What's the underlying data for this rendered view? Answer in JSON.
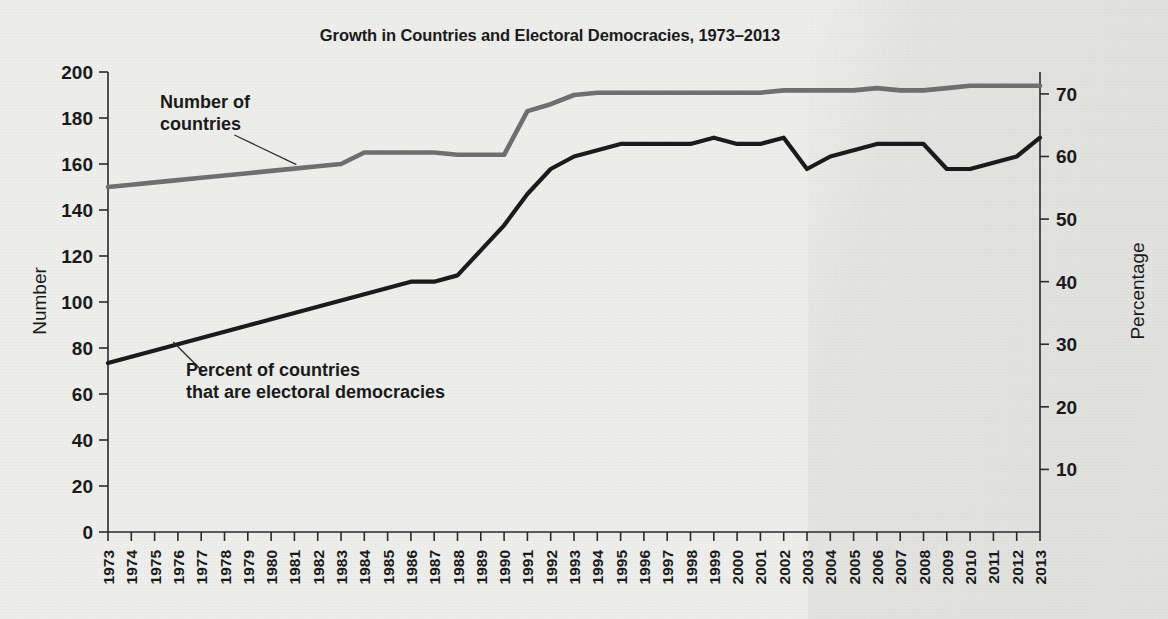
{
  "figure": {
    "title": "Growth in Countries and Electoral Democracies, 1973–2013",
    "left_axis_title": "Number",
    "right_axis_title": "Percentage",
    "annotation_countries": "Number of",
    "annotation_countries_2": "countries",
    "annotation_percent": "Percent of countries",
    "annotation_percent_2": "that are electoral democracies"
  },
  "colors": {
    "countries_line": "#6f6f6f",
    "democracies_line": "#1b1b1b",
    "axis": "#2b2b2b",
    "background": "#eeeeec"
  },
  "chart_data": {
    "type": "line",
    "title": "Growth in Countries and Electoral Democracies, 1973–2013",
    "xlabel": "",
    "ylabel": "Number",
    "y2label": "Percentage",
    "ylim": [
      0,
      200
    ],
    "y2lim": [
      0,
      73.5
    ],
    "yticks": [
      0,
      20,
      40,
      60,
      80,
      100,
      120,
      140,
      160,
      180,
      200
    ],
    "y2ticks": [
      10,
      20,
      30,
      40,
      50,
      60,
      70
    ],
    "grid": false,
    "legend": "annotations-inline",
    "x": [
      1973,
      1974,
      1975,
      1976,
      1977,
      1978,
      1979,
      1980,
      1981,
      1982,
      1983,
      1984,
      1985,
      1986,
      1987,
      1988,
      1989,
      1990,
      1991,
      1992,
      1993,
      1994,
      1995,
      1996,
      1997,
      1998,
      1999,
      2000,
      2001,
      2002,
      2003,
      2004,
      2005,
      2006,
      2007,
      2008,
      2009,
      2010,
      2011,
      2012,
      2013
    ],
    "xtick_labels": [
      "1973",
      "1974",
      "1975",
      "1976",
      "1977",
      "1978",
      "1979",
      "1980",
      "1981",
      "1982",
      "1983",
      "1984",
      "1985",
      "1986",
      "1987",
      "1988",
      "1989",
      "1990",
      "1991",
      "1992",
      "1993",
      "1994",
      "1995",
      "1996",
      "1997",
      "1998",
      "1999",
      "2000",
      "2001",
      "2002",
      "2003",
      "2004",
      "2005",
      "2006",
      "2007",
      "2008",
      "2009",
      "2010",
      "2011",
      "2012",
      "2013"
    ],
    "series": [
      {
        "name": "Number of countries",
        "axis": "left",
        "color": "#6f6f6f",
        "units": "countries",
        "values": [
          150,
          151,
          152,
          153,
          154,
          155,
          156,
          157,
          158,
          159,
          160,
          165,
          165,
          165,
          165,
          164,
          164,
          164,
          183,
          186,
          190,
          191,
          191,
          191,
          191,
          191,
          191,
          191,
          191,
          192,
          192,
          192,
          192,
          193,
          192,
          192,
          193,
          194,
          194,
          194,
          194
        ]
      },
      {
        "name": "Percent of countries that are electoral democracies",
        "axis": "right",
        "color": "#1b1b1b",
        "units": "percent",
        "values": [
          27,
          28,
          29,
          30,
          31,
          32,
          33,
          34,
          35,
          36,
          37,
          38,
          39,
          40,
          40,
          41,
          45,
          49,
          54,
          58,
          60,
          61,
          62,
          62,
          62,
          62,
          63,
          62,
          62,
          63,
          58,
          60,
          61,
          62,
          62,
          62,
          58,
          58,
          59,
          60,
          63
        ]
      }
    ],
    "annotations": [
      {
        "text": "Number of countries",
        "series": "Number of countries",
        "points_to_year": 1981
      },
      {
        "text": "Percent of countries that are electoral democracies",
        "series": "Percent of countries that are electoral democracies",
        "points_to_year": 1977
      }
    ]
  }
}
